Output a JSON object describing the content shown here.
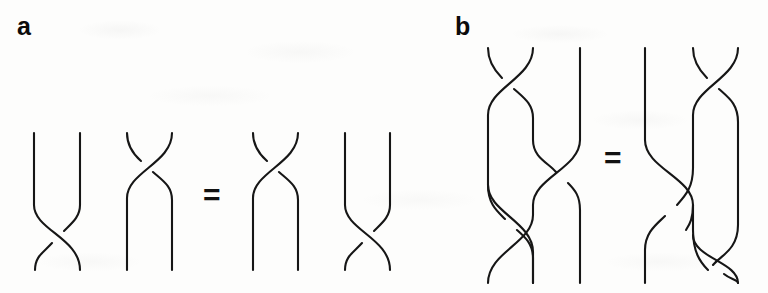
{
  "figure": {
    "type": "braid-group-relation-diagram",
    "background_color": "#fdfdfc",
    "stroke_color": "#161616",
    "width": 768,
    "height": 293
  },
  "panels": [
    {
      "id": "a",
      "label": "a",
      "relation_symbol": "=",
      "description": "Far-commutativity style braid relation on two strands: crossing on the lower part composed with crossing on the upper part equals crossing on the upper part composed with crossing on the lower part.",
      "strand_count": 2,
      "diagrams": [
        {
          "name": "a-left-factor-1",
          "crossing_position": "bottom",
          "strand_tops_x": [
            34,
            80
          ],
          "strand_bottoms_x": [
            35,
            80
          ]
        },
        {
          "name": "a-left-factor-2",
          "crossing_position": "top",
          "strand_tops_x": [
            127,
            172
          ],
          "strand_bottoms_x": [
            127,
            172
          ]
        },
        {
          "name": "a-right-factor-1",
          "crossing_position": "top",
          "strand_tops_x": [
            253,
            298
          ],
          "strand_bottoms_x": [
            253,
            298
          ]
        },
        {
          "name": "a-right-factor-2",
          "crossing_position": "bottom",
          "strand_tops_x": [
            345,
            390
          ],
          "strand_bottoms_x": [
            345,
            390
          ]
        }
      ]
    },
    {
      "id": "b",
      "label": "b",
      "relation_symbol": "=",
      "description": "Yang-Baxter / braid relation on three strands: sigma1 sigma2 sigma1 equals sigma2 sigma1 sigma2.",
      "strand_count": 3,
      "diagrams": [
        {
          "name": "b-left-word",
          "word": "s1 s2 s1",
          "strand_tops_x": [
            488,
            533,
            580
          ],
          "strand_bottoms_x": [
            488,
            533,
            580
          ]
        },
        {
          "name": "b-right-word",
          "word": "s2 s1 s2",
          "strand_tops_x": [
            645,
            693,
            738
          ],
          "strand_bottoms_x": [
            645,
            693,
            738
          ]
        }
      ]
    }
  ],
  "geometry": {
    "panel_a": {
      "top_y": 133,
      "bottom_y": 270,
      "equals_x": 203,
      "equals_y": 180
    },
    "panel_b": {
      "top_y": 48,
      "bottom_y": 283,
      "equals_x": 604,
      "equals_y": 143
    }
  },
  "labels": {
    "panel_a_letter": "a",
    "panel_b_letter": "b",
    "equals_a": "=",
    "equals_b": "="
  }
}
